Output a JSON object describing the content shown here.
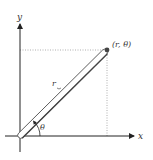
{
  "diagram": {
    "axes": {
      "x_label": "x",
      "y_label": "y"
    },
    "point": {
      "label": "(r, θ)"
    },
    "radius_label": "r",
    "angle_label": "θ",
    "colors": {
      "axis": "#222222",
      "guide": "#9a9a9a",
      "rod": "#555555",
      "point": "#444444"
    }
  }
}
